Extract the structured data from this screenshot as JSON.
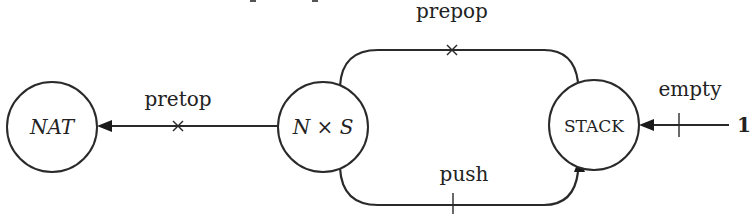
{
  "diagram": {
    "nodes": [
      {
        "id": "nat",
        "label": "NAT",
        "style": "italic"
      },
      {
        "id": "nxs",
        "label": "N × S",
        "style": "italic"
      },
      {
        "id": "stack",
        "label": "STACK",
        "style": "small-caps"
      }
    ],
    "edges": [
      {
        "id": "pretop",
        "label": "pretop",
        "from": "nxs",
        "to": "nat",
        "marker": "cross"
      },
      {
        "id": "prepop",
        "label": "prepop",
        "from": "nxs",
        "to": "stack",
        "marker": "cross"
      },
      {
        "id": "push",
        "label": "push",
        "from": "nxs",
        "to": "stack",
        "marker": "tick"
      },
      {
        "id": "empty",
        "label": "empty",
        "from": "one",
        "to": "stack",
        "marker": "tick"
      }
    ],
    "terminal": {
      "id": "one",
      "label": "1"
    }
  }
}
